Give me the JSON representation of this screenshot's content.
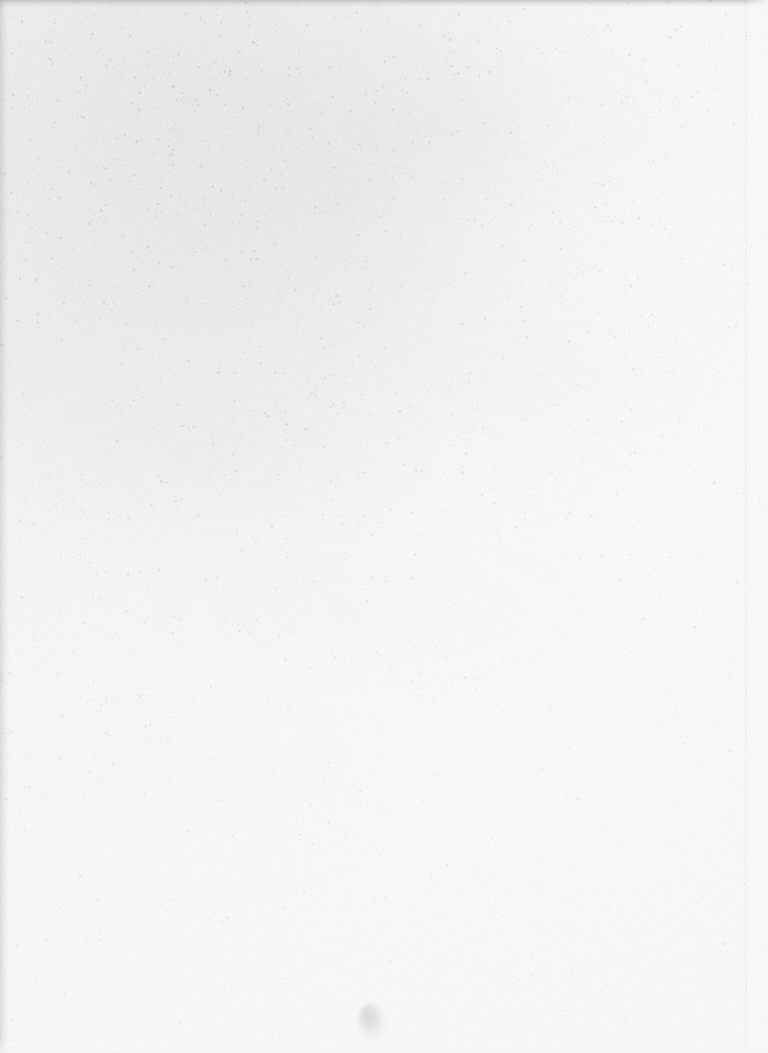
{
  "document": {
    "kind": "scanned-blank-page",
    "description": "Scan of a blank, unprinted page (book flyleaf or verso). No text, figures, rules or page number are present anywhere on the sheet.",
    "text_content": "",
    "page_number": "",
    "canvas": {
      "width": 768,
      "height": 1053
    }
  },
  "paper": {
    "base_color": "#fdfdfd",
    "highlight_color": "#ffffff",
    "shadow_color": "#f8f8f9",
    "grain_color": "#9a9ca2",
    "grain_opacity": 0.19,
    "grain_frequency": 0.86,
    "grain_octaves": 4
  },
  "soiling": {
    "label": "diagonal surface soiling, heaviest at upper-left",
    "origin_x_pct": 20,
    "origin_y_pct": 10,
    "peak_opacity": 0.115,
    "tint": "#96989e"
  },
  "speckle": {
    "label": "dark paper flecks and scanner noise",
    "count": 5200,
    "tint": "#8d8f96",
    "min_radius": 0.32,
    "max_radius": 1.45,
    "max_alpha": 0.3,
    "density_falloff": 1.55,
    "seed": 20194
  },
  "edges": {
    "top": {
      "label": "top scan edge band",
      "height_px": 7,
      "opacity": 0.38
    },
    "left": {
      "label": "left scan edge band",
      "width_px": 9,
      "opacity": 0.26
    },
    "right": {
      "label": "right margin lightening",
      "width_px": 24,
      "opacity": 0.85
    },
    "bottom": {
      "label": "bottom margin lightening",
      "height_px": 16,
      "opacity": 0.75
    },
    "seam": {
      "label": "faint vertical tonal seam",
      "x_px": 745,
      "opacity": 0.1
    }
  },
  "blemishes": [
    {
      "name": "bottom-centre-smudge",
      "label": "small faint grey smudge",
      "x_px": 358,
      "y_px": 1003,
      "width_px": 30,
      "height_px": 38,
      "opacity": 0.3
    }
  ]
}
